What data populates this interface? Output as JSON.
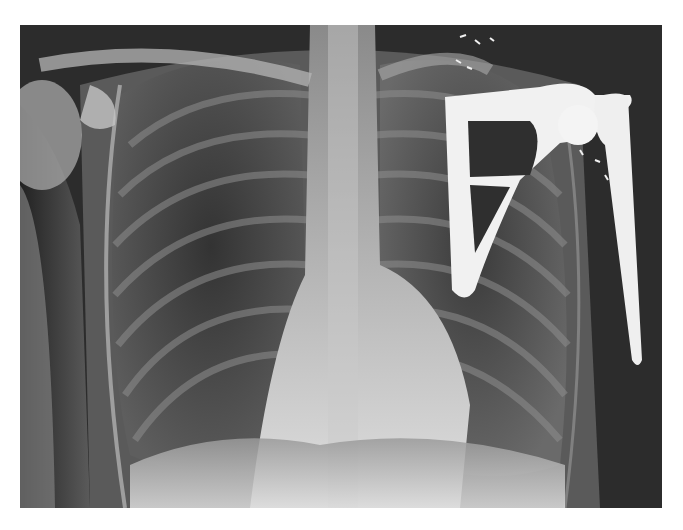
{
  "image": {
    "description": "Frontal chest radiograph showing a left shoulder prosthesis (scapular and humeral implant) with surgical clips",
    "colors": {
      "background": "#ffffff",
      "film_dark": "#262626",
      "bone": "#bfbfbf",
      "implant": "#f2f2f2"
    }
  }
}
